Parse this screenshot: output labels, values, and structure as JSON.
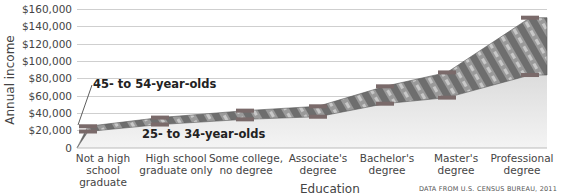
{
  "chart_data": {
    "type": "area",
    "title": "",
    "xlabel": "Education",
    "ylabel": "Annual income",
    "ylim": [
      0,
      160000
    ],
    "y_ticks": [
      "0",
      "$20,000",
      "$40,000",
      "$60,000",
      "$80,000",
      "$100,000",
      "$120,000",
      "$140,000",
      "$160,000"
    ],
    "grid": true,
    "categories": [
      "Not a high school graduate",
      "High school graduate only",
      "Some college, no degree",
      "Associate's degree",
      "Bachelor's degree",
      "Master's degree",
      "Professional degree"
    ],
    "series": [
      {
        "name": "45- to 54-year-olds",
        "values": [
          25000,
          35000,
          43000,
          48000,
          71000,
          87000,
          150000
        ]
      },
      {
        "name": "25- to 34-year-olds",
        "values": [
          19000,
          27000,
          33000,
          36000,
          51000,
          58000,
          84000
        ]
      }
    ],
    "annotations": [
      "45- to 54-year-olds",
      "25- to 34-year-olds"
    ],
    "source": "DATA FROM U.S. CENSUS BUREAU, 2011"
  },
  "axis": {
    "ylabel": "Annual income",
    "xlabel": "Education",
    "yticks": [
      "$160,000",
      "$140,000",
      "$120,000",
      "$100,000",
      "$80,000",
      "$60,000",
      "$40,000",
      "$20,000",
      "0"
    ],
    "xticks": [
      [
        "Not a high",
        "school",
        "graduate"
      ],
      [
        "High school",
        "graduate only"
      ],
      [
        "Some college,",
        "no degree"
      ],
      [
        "Associate's",
        "degree"
      ],
      [
        "Bachelor's",
        "degree"
      ],
      [
        "Master's",
        "degree"
      ],
      [
        "Professional",
        "degree"
      ]
    ]
  },
  "labels": {
    "older": "45- to 54-year-olds",
    "younger": "25- to 34-year-olds",
    "source": "DATA FROM U.S. CENSUS BUREAU, 2011"
  },
  "colors": {
    "band_fill": "#8a8a8a",
    "marker": "#7a6a6a",
    "grid": "#cfcfcf",
    "under_fill": "#ececec"
  }
}
